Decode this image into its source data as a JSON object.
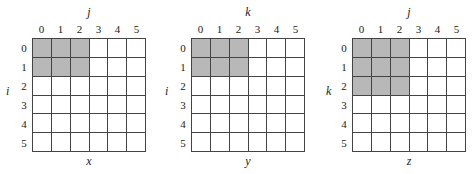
{
  "panels": [
    {
      "name": "x",
      "col_axis": "j",
      "row_axis": "i",
      "col_ticks": [
        "0",
        "1",
        "2",
        "3",
        "4",
        "5"
      ],
      "row_ticks": [
        "0",
        "1",
        "2",
        "3",
        "4",
        "5"
      ],
      "shaded_rows": 2,
      "shaded_cols": 3,
      "shade_color": "#b8b8b8"
    },
    {
      "name": "y",
      "col_axis": "k",
      "row_axis": "i",
      "col_ticks": [
        "0",
        "1",
        "2",
        "3",
        "4",
        "5"
      ],
      "row_ticks": [
        "0",
        "1",
        "2",
        "3",
        "4",
        "5"
      ],
      "shaded_rows": 2,
      "shaded_cols": 3,
      "shade_color": "#b8b8b8"
    },
    {
      "name": "z",
      "col_axis": "j",
      "row_axis": "k",
      "col_ticks": [
        "0",
        "1",
        "2",
        "3",
        "4",
        "5"
      ],
      "row_ticks": [
        "0",
        "1",
        "2",
        "3",
        "4",
        "5"
      ],
      "shaded_rows": 3,
      "shaded_cols": 3,
      "shade_color": "#b8b8b8"
    }
  ]
}
